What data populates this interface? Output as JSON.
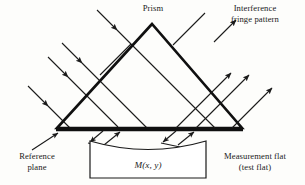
{
  "figure": {
    "type": "optical-ray-diagram"
  },
  "labels": {
    "prism": "Prism",
    "fringe_pattern": "Interference\nfringe pattern",
    "reference_plane": "Reference\nplane",
    "measurement_flat": "Measurement flat\n(test flat)",
    "surface_function": "M(x, y)"
  },
  "colors": {
    "ink": "#1a1a1a",
    "background": "#fdfdfb",
    "ray": "#1a1a1a",
    "prism_outline": "#101010"
  },
  "geometry": {
    "prism": {
      "apex": [
        152,
        24
      ],
      "base_left": [
        57,
        128
      ],
      "base_right": [
        242,
        128
      ],
      "outline_width": 2.6
    },
    "reference_plane": {
      "note": "thick bold base line of prism",
      "from": [
        57,
        129
      ],
      "to": [
        242,
        129
      ],
      "width": 3.2
    },
    "measurement_flat": {
      "box_left": 90,
      "box_right": 206,
      "box_top": 141,
      "box_bottom": 178,
      "top_edge": "concave sagging curve"
    },
    "incoming_rays": {
      "count": 4,
      "direction": "down-right",
      "angle_deg": 45
    },
    "outgoing_rays": {
      "count": 4,
      "direction": "up-right",
      "angle_deg": -45
    },
    "reflected_pairs": {
      "count": 2,
      "description": "V-shaped arrow pairs between reference plane and measurement flat"
    }
  }
}
